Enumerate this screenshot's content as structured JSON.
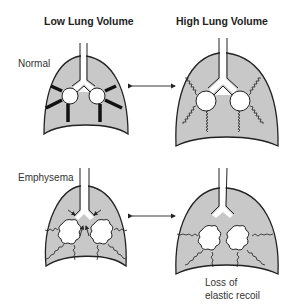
{
  "columns": {
    "low": {
      "title": "Low Lung Volume"
    },
    "high": {
      "title": "High Lung Volume"
    }
  },
  "rows": {
    "normal": {
      "label": "Normal"
    },
    "emphysema": {
      "label": "Emphysema"
    }
  },
  "annotations": {
    "loss_line1": "Loss of",
    "loss_line2": "elastic recoil"
  },
  "colors": {
    "lung_fill": "#c8c8c8",
    "outline": "#222222",
    "background": "#ffffff"
  }
}
